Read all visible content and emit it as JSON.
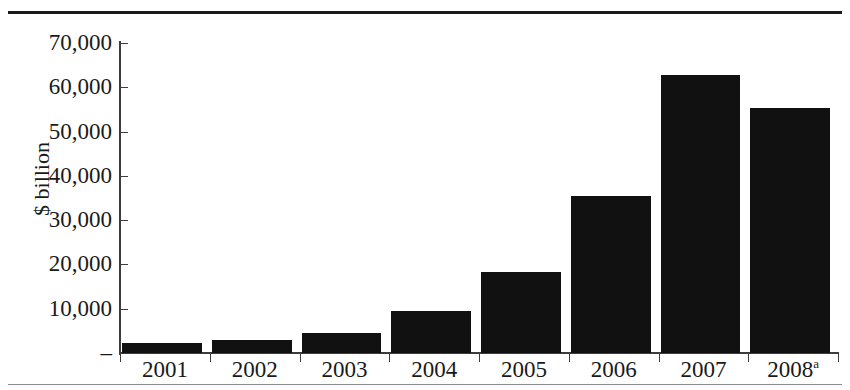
{
  "chart_data": {
    "type": "bar",
    "title": "",
    "xlabel": "",
    "ylabel": "$ billion",
    "categories": [
      "2001",
      "2002",
      "2003",
      "2004",
      "2005",
      "2006",
      "2007",
      "2008"
    ],
    "category_labels": [
      "2001",
      "2002",
      "2003",
      "2004",
      "2005",
      "2006",
      "2007",
      "2008"
    ],
    "category_footnotes": [
      "",
      "",
      "",
      "",
      "",
      "",
      "",
      "a"
    ],
    "values": [
      2250,
      2900,
      4500,
      9500,
      18300,
      35400,
      62700,
      55300
    ],
    "ylim": [
      0,
      70000
    ],
    "ytick_values": [
      0,
      10000,
      20000,
      30000,
      40000,
      50000,
      60000,
      70000
    ],
    "ytick_labels": [
      "–",
      "10,000",
      "20,000",
      "30,000",
      "40,000",
      "50,000",
      "60,000",
      "70,000"
    ],
    "grid": false,
    "legend": null,
    "bar_color": "#111111",
    "background_color": "#ffffff",
    "axis_color": "#3d3d3d"
  },
  "frame": {
    "top_rule_color": "#1b1b1b",
    "bottom_rule_color": "#8d8d8d"
  }
}
